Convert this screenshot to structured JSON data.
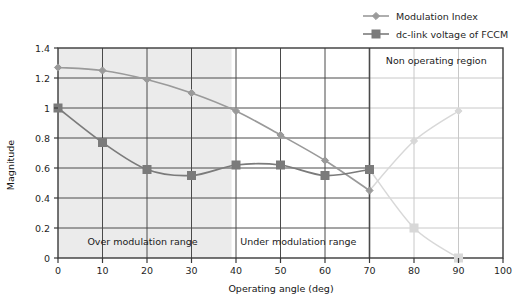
{
  "chart_data": {
    "type": "line",
    "title": "",
    "xlabel": "Operating angle (deg)",
    "ylabel": "Magnitude",
    "xlim": [
      0,
      100
    ],
    "ylim": [
      0,
      1.4
    ],
    "xticks": [
      0,
      10,
      20,
      30,
      40,
      50,
      60,
      70,
      80,
      90,
      100
    ],
    "yticks": [
      0,
      0.2,
      0.4,
      0.6,
      0.8,
      1,
      1.2,
      1.4
    ],
    "xtick_labels": [
      "0",
      "10",
      "20",
      "30",
      "40",
      "50",
      "60",
      "70",
      "80",
      "90",
      "100"
    ],
    "ytick_labels": [
      "0",
      "0.2",
      "0.4",
      "0.6",
      "0.8",
      "1",
      "1.2",
      "1.4"
    ],
    "grid": true,
    "legend_position": "top-right",
    "x": [
      0,
      10,
      20,
      30,
      40,
      50,
      60,
      70,
      80,
      90
    ],
    "series": [
      {
        "name": "Modulation Index",
        "marker": "diamond",
        "color": "#9a9a9a",
        "values": [
          1.27,
          1.25,
          1.19,
          1.1,
          0.98,
          0.82,
          0.65,
          0.45,
          0.78,
          0.98
        ],
        "faded_from_index": 7
      },
      {
        "name": "dc-link voltage of FCCM",
        "marker": "square",
        "color": "#7b7b7b",
        "values": [
          1.0,
          0.77,
          0.59,
          0.55,
          0.62,
          0.62,
          0.55,
          0.59,
          0.2,
          0.0
        ],
        "faded_from_index": 7
      }
    ],
    "annotations": [
      {
        "text": "Non operating region",
        "x": 85,
        "y": 1.32,
        "name": "non-operating-region-label"
      },
      {
        "text": "Over modulation range",
        "x": 19,
        "y": 0.11,
        "name": "over-modulation-range-label"
      },
      {
        "text": "Under modulation range",
        "x": 54,
        "y": 0.11,
        "name": "under-modulation-range-label"
      }
    ],
    "shaded_regions": [
      {
        "name": "over-modulation-shading",
        "x_start": 0,
        "x_end": 39,
        "color": "#ebebeb"
      }
    ],
    "separator_lines": [
      {
        "name": "region-divider-70",
        "x": 70
      }
    ]
  },
  "legend": {
    "items": [
      {
        "label": "Modulation Index",
        "marker": "diamond"
      },
      {
        "label": "dc-link voltage of FCCM",
        "marker": "square"
      }
    ]
  },
  "colors": {
    "plot_border": "#3a3a3a",
    "grid": "#4a4a4a",
    "grid_faded": "#c8c8c8",
    "shading": "#ebebeb",
    "series_modulation_index": "#9a9a9a",
    "series_dclink": "#7b7b7b",
    "series_faded": "#d8d8d8",
    "text": "#1a1a1a",
    "background": "#ffffff"
  }
}
